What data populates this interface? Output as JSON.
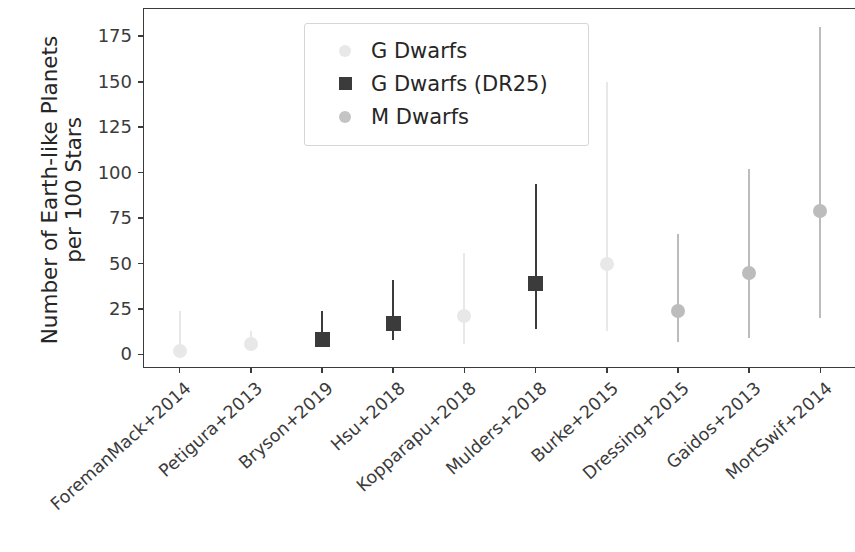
{
  "chart_data": {
    "type": "scatter",
    "title": "",
    "xlabel": "",
    "ylabel": "Number of Earth-like Planets\nper 100 Stars",
    "ylabel_line1": "Number of Earth-like Planets",
    "ylabel_line2": "per 100 Stars",
    "ylim": [
      -8,
      190
    ],
    "ytick_labels": [
      "0",
      "25",
      "50",
      "75",
      "100",
      "125",
      "150",
      "175"
    ],
    "yticks": [
      0,
      25,
      50,
      75,
      100,
      125,
      150,
      175
    ],
    "grid": false,
    "legend_position": "upper left",
    "legend": [
      {
        "label": "G Dwarfs",
        "marker": "circle",
        "color": "#e8e8e8"
      },
      {
        "label": "G Dwarfs (DR25)",
        "marker": "square",
        "color": "#3b3b3b"
      },
      {
        "label": "M Dwarfs",
        "marker": "circle",
        "color": "#c4c4c4"
      }
    ],
    "categories": [
      "ForemanMack+2014",
      "Petigura+2013",
      "Bryson+2019",
      "Hsu+2018",
      "Kopparapu+2018",
      "Mulders+2018",
      "Burke+2015",
      "Dressing+2015",
      "Gaidos+2013",
      "MortSwif+2014"
    ],
    "series": [
      {
        "name": "G Dwarfs",
        "marker": "circle",
        "color": "#e8e8e8",
        "points": [
          {
            "category": "ForemanMack+2014",
            "value": 2,
            "low": 0,
            "high": 24
          },
          {
            "category": "Petigura+2013",
            "value": 6,
            "low": 3,
            "high": 13
          },
          {
            "category": "Kopparapu+2018",
            "value": 21,
            "low": 6,
            "high": 56
          },
          {
            "category": "Burke+2015",
            "value": 50,
            "low": 13,
            "high": 150
          }
        ]
      },
      {
        "name": "G Dwarfs (DR25)",
        "marker": "square",
        "color": "#3b3b3b",
        "points": [
          {
            "category": "Bryson+2019",
            "value": 8,
            "low": 4,
            "high": 24
          },
          {
            "category": "Hsu+2018",
            "value": 17,
            "low": 8,
            "high": 41
          },
          {
            "category": "Mulders+2018",
            "value": 39,
            "low": 14,
            "high": 94
          }
        ]
      },
      {
        "name": "M Dwarfs",
        "marker": "circle",
        "color": "#bcbcbc",
        "points": [
          {
            "category": "Dressing+2015",
            "value": 24,
            "low": 7,
            "high": 66
          },
          {
            "category": "Gaidos+2013",
            "value": 45,
            "low": 9,
            "high": 102
          },
          {
            "category": "MortSwif+2014",
            "value": 79,
            "low": 20,
            "high": 180
          }
        ]
      }
    ]
  },
  "axis": {
    "y_title_line1": "Number of Earth-like Planets",
    "y_title_line2": "per 100 Stars"
  }
}
